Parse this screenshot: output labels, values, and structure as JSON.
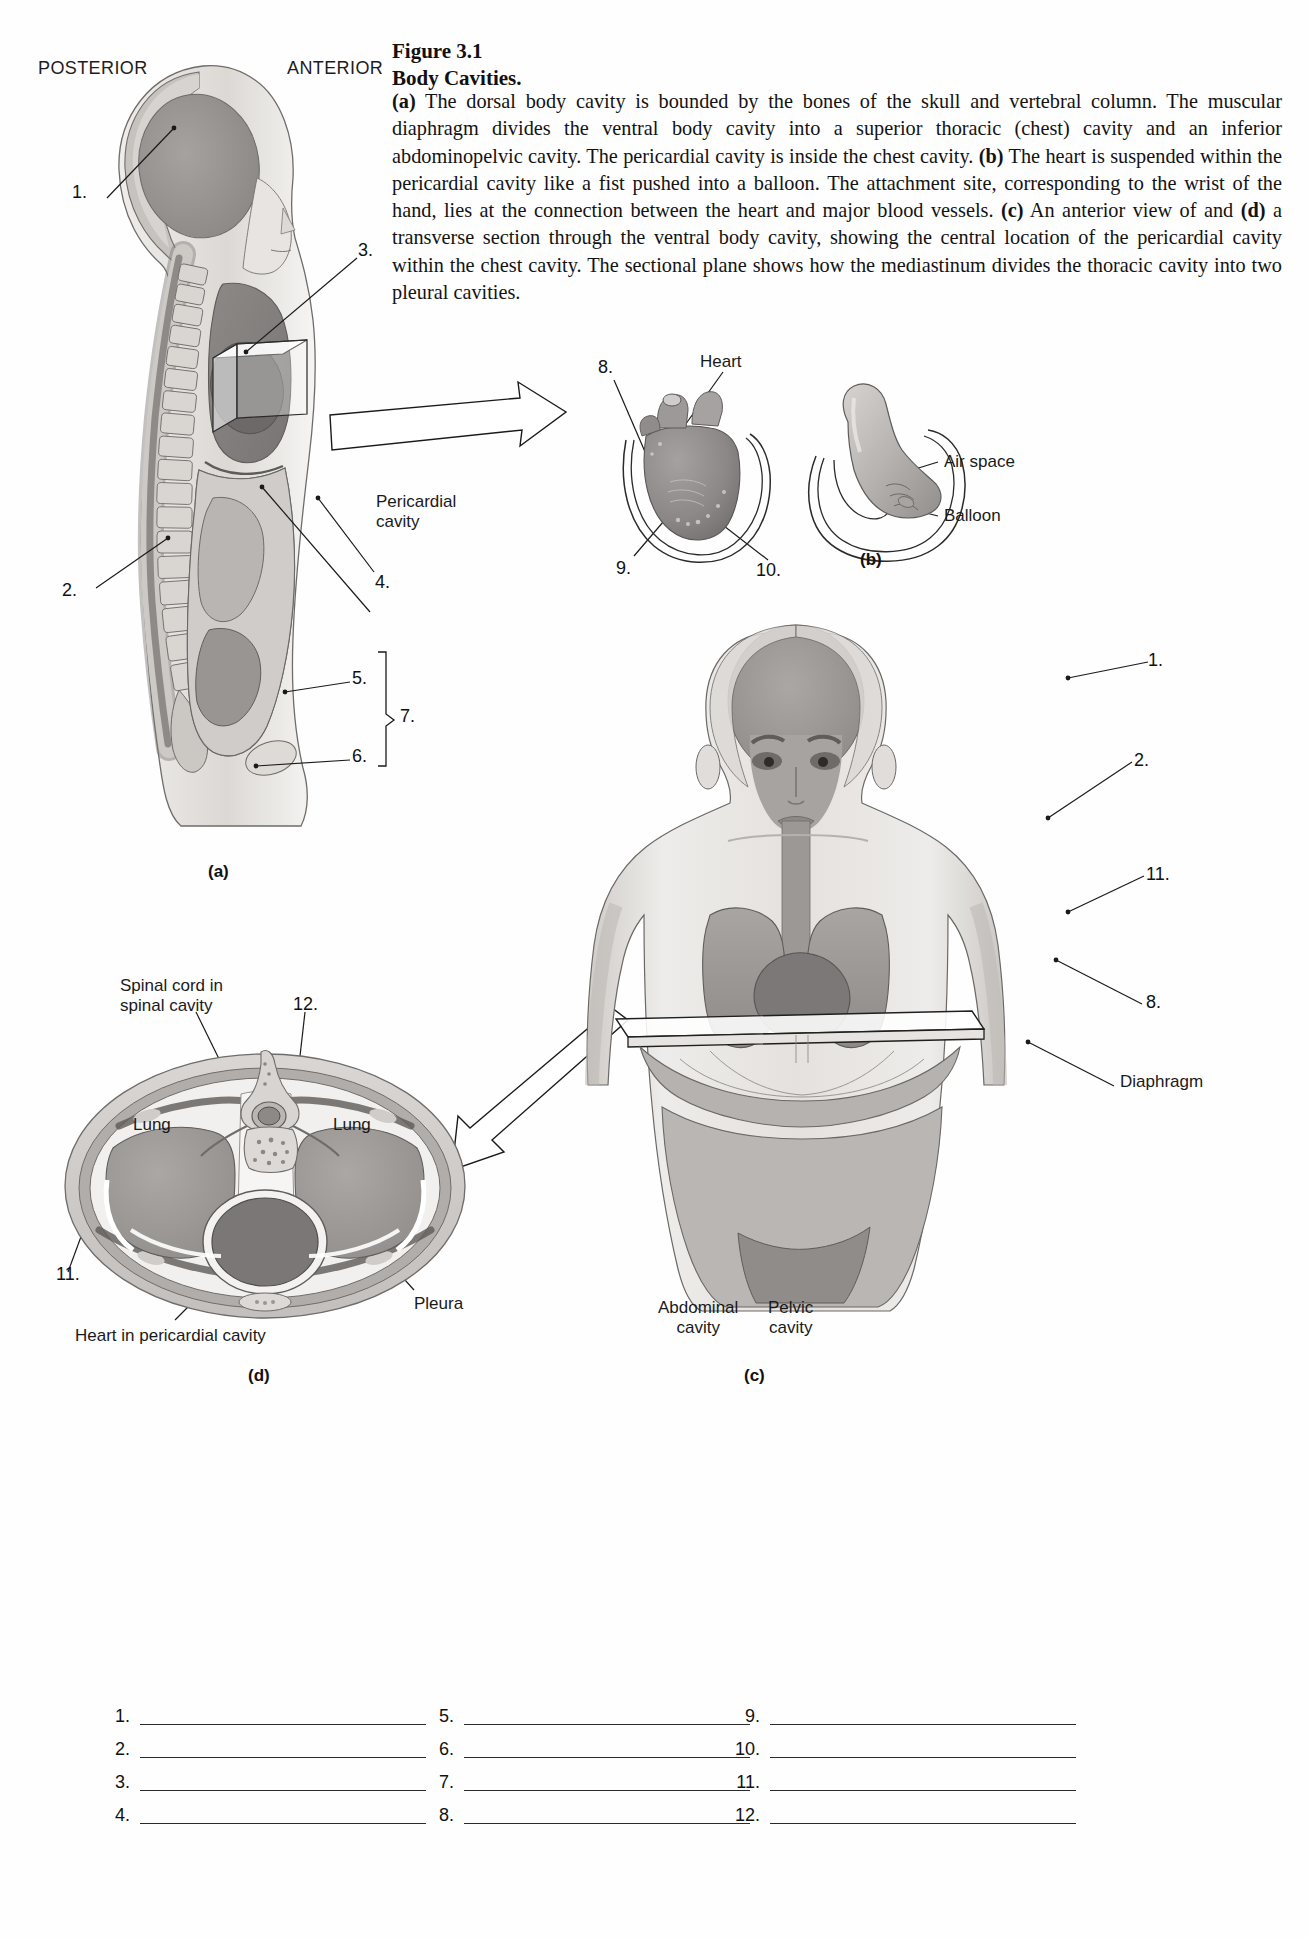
{
  "figure": {
    "number_label": "Figure 3.1",
    "title": "Body Cavities.",
    "caption_a_bold": "(a)",
    "caption_part1": " The dorsal body cavity is bounded by the bones of the skull and vertebral column. The muscular diaphragm divides the ventral body cavity into a superior thoracic (chest) cavity and an inferior abdominopelvic cavity. The pericardial cavity is inside the chest cavity. ",
    "caption_b_bold": "(b)",
    "caption_part2": " The heart is suspended within the pericardial cavity like a fist pushed into a balloon. The attachment site, corresponding to the wrist of the hand, lies at the connection between the heart and major blood vessels. ",
    "caption_c_bold": "(c)",
    "caption_part3": " An anterior view of and ",
    "caption_d_bold": "(d)",
    "caption_part4": " a transverse section through the ventral body cavity, showing the central location of the pericardial cavity within the chest cavity. The sectional plane shows how the mediastinum divides the thoracic cavity into two pleural cavities."
  },
  "orientation": {
    "posterior": "POSTERIOR",
    "anterior": "ANTERIOR"
  },
  "panel_ids": {
    "a": "(a)",
    "b": "(b)",
    "c": "(c)",
    "d": "(d)"
  },
  "panel_a": {
    "numbers": [
      "1.",
      "2.",
      "3.",
      "4.",
      "5.",
      "6.",
      "7."
    ],
    "text_labels": [
      "Pericardial\ncavity"
    ]
  },
  "panel_heart": {
    "numbers": [
      "8.",
      "9.",
      "10."
    ],
    "text_labels": [
      "Heart"
    ]
  },
  "panel_b": {
    "text_labels": [
      "Air space",
      "Balloon"
    ]
  },
  "panel_c": {
    "numbers": [
      "1.",
      "2.",
      "11.",
      "8."
    ],
    "text_labels": [
      "Diaphragm",
      "Abdominal\ncavity",
      "Pelvic\ncavity"
    ]
  },
  "panel_d": {
    "numbers": [
      "12.",
      "11."
    ],
    "text_labels": [
      "Spinal cord in\nspinal cavity",
      "Lung",
      "Lung",
      "Pleura",
      "Heart in pericardial cavity"
    ]
  },
  "answer_blanks": {
    "column1": [
      "1.",
      "2.",
      "3.",
      "4."
    ],
    "column2": [
      "5.",
      "6.",
      "7.",
      "8."
    ],
    "column3": [
      "9.",
      "10.",
      "11.",
      "12."
    ]
  },
  "colors": {
    "ink": "#1a1a1a",
    "tissue_light": "#d8d5d2",
    "tissue_mid": "#b0aeac",
    "tissue_dark": "#8e8c8a",
    "organ_dark": "#7f7d7b",
    "cavity_pale": "#edebe8",
    "bone": "#c9c6c2"
  }
}
